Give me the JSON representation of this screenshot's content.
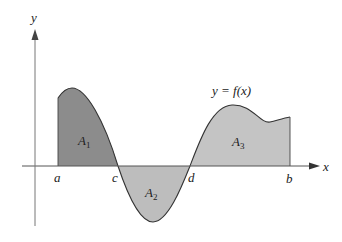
{
  "figure": {
    "type": "area-under-curve",
    "function_label": "y = f(x)",
    "axes": {
      "x_label": "x",
      "y_label": "y"
    },
    "points": [
      {
        "name": "a",
        "label": "a"
      },
      {
        "name": "c",
        "label": "c"
      },
      {
        "name": "d",
        "label": "d"
      },
      {
        "name": "b",
        "label": "b"
      }
    ],
    "regions": [
      {
        "name": "A1",
        "label_main": "A",
        "label_sub": "1",
        "interval": "[a, c]",
        "sign": "positive",
        "fill": "#8c8c8c"
      },
      {
        "name": "A2",
        "label_main": "A",
        "label_sub": "2",
        "interval": "[c, d]",
        "sign": "negative",
        "fill": "#bdbdbd"
      },
      {
        "name": "A3",
        "label_main": "A",
        "label_sub": "3",
        "interval": "[d, b]",
        "sign": "positive",
        "fill": "#c4c4c4"
      }
    ],
    "colors": {
      "axis": "#555555",
      "curve": "#333333",
      "region_dark": "#8c8c8c",
      "region_light": "#c0c0c0"
    }
  }
}
